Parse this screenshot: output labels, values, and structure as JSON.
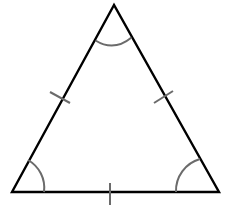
{
  "diagram": {
    "type": "equilateral-triangle",
    "colors": {
      "outline": "#000000",
      "marks": "#6b6b6b",
      "background": "#ffffff"
    },
    "vertices": {
      "apex": [
        114,
        5
      ],
      "bottom_left": [
        12,
        192
      ],
      "bottom_right": [
        219,
        192
      ]
    },
    "side_ticks": [
      {
        "side": "left",
        "count": 1
      },
      {
        "side": "right",
        "count": 1
      },
      {
        "side": "bottom",
        "count": 1
      }
    ],
    "angle_arcs": [
      {
        "vertex": "apex",
        "count": 1
      },
      {
        "vertex": "bottom_left",
        "count": 1
      },
      {
        "vertex": "bottom_right",
        "count": 1
      }
    ]
  }
}
